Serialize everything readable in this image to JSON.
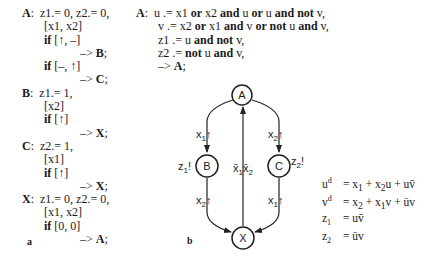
{
  "panel_a": {
    "label": "a",
    "lines": [
      {
        "indent": 0,
        "parts": [
          {
            "t": "A",
            "b": true
          },
          {
            "t": ":  z1.= 0, z2.= 0,",
            "b": false
          }
        ]
      },
      {
        "indent": 1,
        "parts": [
          {
            "t": "[x1, x2]",
            "b": false
          }
        ]
      },
      {
        "indent": 1,
        "parts": [
          {
            "t": "if",
            "b": true
          },
          {
            "t": " [↑, –]",
            "b": false
          }
        ]
      },
      {
        "indent": 2,
        "parts": [
          {
            "t": "–> ",
            "b": false
          },
          {
            "t": "B",
            "b": true
          },
          {
            "t": ";",
            "b": false
          }
        ]
      },
      {
        "indent": 1,
        "parts": [
          {
            "t": "if",
            "b": true
          },
          {
            "t": " [–, ↑]",
            "b": false
          }
        ]
      },
      {
        "indent": 2,
        "parts": [
          {
            "t": "–> ",
            "b": false
          },
          {
            "t": "C",
            "b": true
          },
          {
            "t": ";",
            "b": false
          }
        ]
      },
      {
        "indent": 0,
        "parts": [
          {
            "t": "B",
            "b": true
          },
          {
            "t": ":  z1.= 1,",
            "b": false
          }
        ]
      },
      {
        "indent": 1,
        "parts": [
          {
            "t": "[x2]",
            "b": false
          }
        ]
      },
      {
        "indent": 1,
        "parts": [
          {
            "t": "if",
            "b": true
          },
          {
            "t": " [↑]",
            "b": false
          }
        ]
      },
      {
        "indent": 2,
        "parts": [
          {
            "t": "–> ",
            "b": false
          },
          {
            "t": "X",
            "b": true
          },
          {
            "t": ";",
            "b": false
          }
        ]
      },
      {
        "indent": 0,
        "parts": [
          {
            "t": "C",
            "b": true
          },
          {
            "t": ":  z2.= 1,",
            "b": false
          }
        ]
      },
      {
        "indent": 1,
        "parts": [
          {
            "t": "[x1]",
            "b": false
          }
        ]
      },
      {
        "indent": 1,
        "parts": [
          {
            "t": "if",
            "b": true
          },
          {
            "t": " [↑]",
            "b": false
          }
        ]
      },
      {
        "indent": 2,
        "parts": [
          {
            "t": "–> ",
            "b": false
          },
          {
            "t": "X",
            "b": true
          },
          {
            "t": ";",
            "b": false
          }
        ]
      },
      {
        "indent": 0,
        "parts": [
          {
            "t": "X",
            "b": true
          },
          {
            "t": ":  z1.= 0, z2.= 0,",
            "b": false
          }
        ]
      },
      {
        "indent": 1,
        "parts": [
          {
            "t": "[x1, x2]",
            "b": false
          }
        ]
      },
      {
        "indent": 1,
        "parts": [
          {
            "t": "if",
            "b": true
          },
          {
            "t": " [0, 0]",
            "b": false
          }
        ]
      },
      {
        "indent": 2,
        "parts": [
          {
            "t": "–> ",
            "b": false
          },
          {
            "t": "A",
            "b": true
          },
          {
            "t": ";",
            "b": false
          }
        ]
      }
    ]
  },
  "panel_right_code": {
    "lines": [
      {
        "indent": 0,
        "parts": [
          {
            "t": "A",
            "b": true
          },
          {
            "t": ":  u .= x1 ",
            "b": false
          },
          {
            "t": "or",
            "b": true
          },
          {
            "t": " x2 ",
            "b": false
          },
          {
            "t": "and",
            "b": true
          },
          {
            "t": " u ",
            "b": false
          },
          {
            "t": "or",
            "b": true
          },
          {
            "t": " u ",
            "b": false
          },
          {
            "t": "and not",
            "b": true
          },
          {
            "t": " v,",
            "b": false
          }
        ]
      },
      {
        "indent": 1,
        "parts": [
          {
            "t": "v .= x2 ",
            "b": false
          },
          {
            "t": "or",
            "b": true
          },
          {
            "t": " x1 ",
            "b": false
          },
          {
            "t": "and",
            "b": true
          },
          {
            "t": " v ",
            "b": false
          },
          {
            "t": "or not",
            "b": true
          },
          {
            "t": " u ",
            "b": false
          },
          {
            "t": "and",
            "b": true
          },
          {
            "t": " v,",
            "b": false
          }
        ]
      },
      {
        "indent": 1,
        "parts": [
          {
            "t": "z1 .= u ",
            "b": false
          },
          {
            "t": "and not",
            "b": true
          },
          {
            "t": " v,",
            "b": false
          }
        ]
      },
      {
        "indent": 1,
        "parts": [
          {
            "t": "z2 .= ",
            "b": false
          },
          {
            "t": "not",
            "b": true
          },
          {
            "t": " u ",
            "b": false
          },
          {
            "t": "and",
            "b": true
          },
          {
            "t": " v,",
            "b": false
          }
        ]
      },
      {
        "indent": 1,
        "parts": [
          {
            "t": "–> ",
            "b": false
          },
          {
            "t": "A",
            "b": true
          },
          {
            "t": ";",
            "b": false
          }
        ]
      }
    ]
  },
  "panel_b": {
    "label": "b",
    "nodes": {
      "A": "A",
      "B": "B",
      "C": "C",
      "X": "X"
    },
    "edge_labels": {
      "a_to_b": {
        "base": "x",
        "sub": "1",
        "sym": "↑"
      },
      "a_to_c": {
        "base": "x",
        "sub": "2",
        "sym": "↑"
      },
      "x_to_a": {
        "text": "x̄₁x̄₂"
      },
      "b_to_x": {
        "base": "x",
        "sub": "2",
        "sym": "↑"
      },
      "c_to_x": {
        "base": "x",
        "sub": "1",
        "sym": "↑"
      }
    },
    "outputs": {
      "B": {
        "base": "z",
        "sub": "1",
        "sym": "!"
      },
      "C": {
        "base": "z",
        "sub": "2",
        "sym": "!"
      }
    },
    "equations": [
      {
        "lhs": "u",
        "sup": "d",
        "rhs_html": "x<sub>1</sub> + x<sub>2</sub>u + uv̄"
      },
      {
        "lhs": "v",
        "sup": "d",
        "rhs_html": "x<sub>2</sub> + x<sub>1</sub>v + ūv"
      },
      {
        "lhs": "z",
        "sub": "1",
        "rhs_html": "uv̄"
      },
      {
        "lhs": "z",
        "sub": "2",
        "rhs_html": "ūv"
      }
    ]
  }
}
